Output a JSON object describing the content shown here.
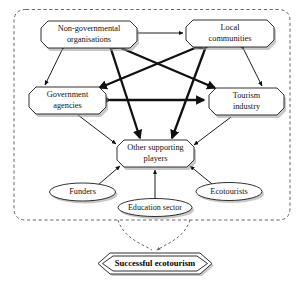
{
  "figure": {
    "type": "stakeholder-network-diagram",
    "boundary_style": "dashed rounded rectangle enclosing the stakeholder network",
    "colors": {
      "node_fill": "#ffffff",
      "node_stroke": "#1a1a1a",
      "boundary_stroke": "#555555",
      "edge": "#111111",
      "shadow": "#9a9a9a"
    }
  },
  "nodes": {
    "ngo": {
      "label_line1": "Non-governmental",
      "label_line2": "organisations",
      "shape": "octagon"
    },
    "local_communities": {
      "label_line1": "Local",
      "label_line2": "communities",
      "shape": "octagon"
    },
    "government_agencies": {
      "label_line1": "Government",
      "label_line2": "agencies",
      "shape": "octagon"
    },
    "tourism_industry": {
      "label_line1": "Tourism",
      "label_line2": "industry",
      "shape": "octagon"
    },
    "other_supporting_players": {
      "label_line1": "Other supporting",
      "label_line2": "players",
      "shape": "octagon"
    },
    "funders": {
      "label": "Funders",
      "shape": "ellipse"
    },
    "education_sector": {
      "label": "Education sector",
      "shape": "ellipse"
    },
    "ecotourists": {
      "label": "Ecotourists",
      "shape": "ellipse"
    },
    "goal": {
      "label": "Successful ecotourism",
      "shape": "double-hexagon"
    }
  },
  "edges": [
    {
      "from": "ngo",
      "to": "local_communities",
      "weight": "thin",
      "direction": "both"
    },
    {
      "from": "ngo",
      "to": "government_agencies",
      "weight": "thin",
      "direction": "both"
    },
    {
      "from": "local_communities",
      "to": "tourism_industry",
      "weight": "thin",
      "direction": "both"
    },
    {
      "from": "ngo",
      "to": "tourism_industry",
      "weight": "thick",
      "direction": "both"
    },
    {
      "from": "local_communities",
      "to": "government_agencies",
      "weight": "thick",
      "direction": "both"
    },
    {
      "from": "government_agencies",
      "to": "tourism_industry",
      "weight": "thick",
      "direction": "both"
    },
    {
      "from": "ngo",
      "to": "other_supporting_players",
      "weight": "thick",
      "direction": "both"
    },
    {
      "from": "local_communities",
      "to": "other_supporting_players",
      "weight": "thick",
      "direction": "both"
    },
    {
      "from": "government_agencies",
      "to": "other_supporting_players",
      "weight": "thin",
      "direction": "to"
    },
    {
      "from": "tourism_industry",
      "to": "other_supporting_players",
      "weight": "thin",
      "direction": "to"
    },
    {
      "from": "funders",
      "to": "other_supporting_players",
      "weight": "thin",
      "direction": "to"
    },
    {
      "from": "education_sector",
      "to": "other_supporting_players",
      "weight": "thin",
      "direction": "to"
    },
    {
      "from": "ecotourists",
      "to": "other_supporting_players",
      "weight": "thin",
      "direction": "to"
    },
    {
      "from": "network_boundary",
      "to": "goal",
      "weight": "dashed-funnel",
      "direction": "to"
    }
  ]
}
